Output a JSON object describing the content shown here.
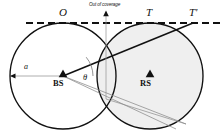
{
  "figure": {
    "title_note": "Out of coverage",
    "labels": {
      "point_o": "O",
      "point_t": "T",
      "point_t_prime": "T'",
      "radius": "a",
      "angle": "θ",
      "base_station": "BS",
      "relay_station": "RS",
      "out_of_coverage": "Out of coverage"
    },
    "colors": {
      "stroke": "#111111",
      "shaded_fill": "#efefef",
      "thin_line": "#8a8a8a",
      "background": "#ffffff"
    },
    "geometry": {
      "left_circle": {
        "cx": 63,
        "cy": 76,
        "r": 53
      },
      "right_circle": {
        "cx": 150,
        "cy": 76,
        "r": 53
      },
      "tangent_line_y": 23,
      "bs_point": {
        "x": 63,
        "y": 76
      },
      "rs_point": {
        "x": 150,
        "y": 76
      },
      "t_point": {
        "x": 150,
        "y": 23
      },
      "t_prime_point": {
        "x": 193,
        "y": 23
      },
      "o_point": {
        "x": 63,
        "y": 23
      },
      "intersection_x": 106
    }
  }
}
